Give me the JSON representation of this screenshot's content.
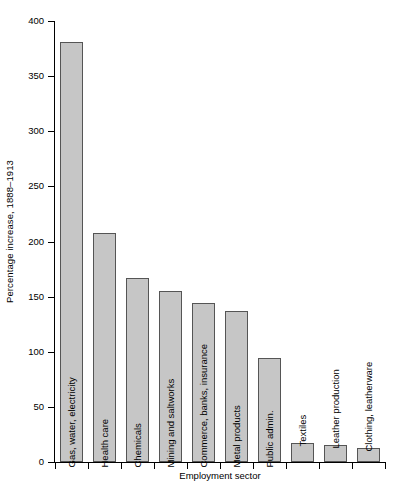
{
  "chart_data": {
    "type": "bar",
    "title": "",
    "xlabel": "Employment sector",
    "ylabel": "Percentage increase, 1888–1913",
    "ylim": [
      0,
      400
    ],
    "yticks": [
      0,
      50,
      100,
      150,
      200,
      250,
      300,
      350,
      400
    ],
    "grid": false,
    "legend": null,
    "bar_color": "#c6c6c6",
    "bar_edge_color": "#555555",
    "categories": [
      "Gas, water, electricity",
      "Health care",
      "Chemicals",
      "Mining and saltworks",
      "Commerce, banks, insurance",
      "Metal products",
      "Public admin.",
      "Textiles",
      "Leather production",
      "Clothing, leatherware"
    ],
    "values": [
      381,
      208,
      167,
      155,
      144,
      137,
      94,
      17,
      15,
      13
    ],
    "bars": [
      {
        "label": "Gas, water, electricity",
        "value": 381,
        "label_inside": true
      },
      {
        "label": "Health care",
        "value": 208,
        "label_inside": true
      },
      {
        "label": "Chemicals",
        "value": 167,
        "label_inside": true
      },
      {
        "label": "Mining and saltworks",
        "value": 155,
        "label_inside": true
      },
      {
        "label": "Commerce, banks, insurance",
        "value": 144,
        "label_inside": true
      },
      {
        "label": "Metal products",
        "value": 137,
        "label_inside": true
      },
      {
        "label": "Public admin.",
        "value": 94,
        "label_inside": true
      },
      {
        "label": "Textiles",
        "value": 17,
        "label_inside": false
      },
      {
        "label": "Leather production",
        "value": 15,
        "label_inside": false
      },
      {
        "label": "Clothing, leatherware",
        "value": 13,
        "label_inside": false
      }
    ]
  }
}
